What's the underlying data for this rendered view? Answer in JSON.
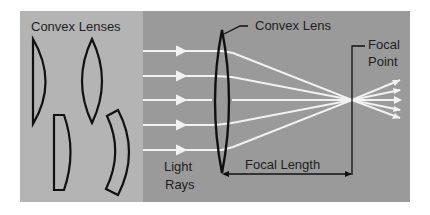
{
  "title": "Convex Lenses",
  "labels": {
    "lens": "Convex Lens",
    "focal_point_line1": "Focal",
    "focal_point_line2": "Point",
    "light_line1": "Light",
    "light_line2": "Rays",
    "focal_length": "Focal Length"
  },
  "colors": {
    "left_panel": "#b4b4b4",
    "right_panel": "#9a9a9a",
    "rays": "#f2f2f2",
    "outline": "#111111"
  },
  "lens_shapes": [
    "plano-convex",
    "biconvex",
    "plano-convex-flat",
    "meniscus"
  ]
}
